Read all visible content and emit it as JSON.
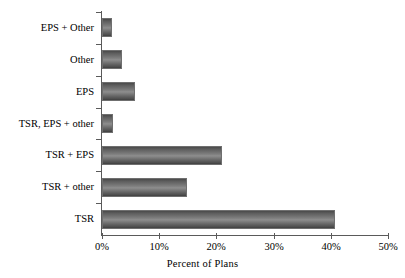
{
  "chart_data": {
    "type": "bar",
    "orientation": "horizontal",
    "title": "",
    "subtitle": "",
    "xlabel": "Percent of Plans",
    "ylabel": "",
    "categories": [
      "TSR",
      "TSR + other",
      "TSR + EPS",
      "TSR, EPS + other",
      "EPS",
      "Other",
      "EPS + Other"
    ],
    "values": [
      40.8,
      14.9,
      21.0,
      1.9,
      5.8,
      3.5,
      1.8
    ],
    "series": [
      {
        "name": "Percent of Plans",
        "values": [
          40.8,
          14.9,
          21.0,
          1.9,
          5.8,
          3.5,
          1.8
        ]
      }
    ],
    "xlim": [
      0,
      50
    ],
    "xticks": [
      0,
      10,
      20,
      30,
      40,
      50
    ],
    "xticklabels": [
      "0%",
      "10%",
      "20%",
      "30%",
      "40%",
      "50%"
    ],
    "grid": false,
    "legend": false,
    "legend_position": "none",
    "bar_color": "#7a7a7a",
    "bar_edge_color": "#6f6f6f",
    "axis_color": "#5a5a5a",
    "background_color": "#ffffff",
    "value_format": "percent"
  },
  "axis": {
    "x_title": "Percent of Plans"
  }
}
